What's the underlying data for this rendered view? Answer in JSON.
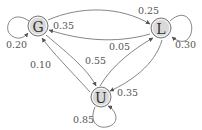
{
  "diagram": {
    "type": "markov-chain-state-diagram",
    "colors": {
      "node_fill": "#d9d9d9",
      "node_stroke": "#7a7a7a",
      "edge": "#777777",
      "text": "#333333"
    },
    "nodes": [
      {
        "id": "G",
        "label": "G"
      },
      {
        "id": "L",
        "label": "L"
      },
      {
        "id": "U",
        "label": "U"
      }
    ],
    "edges": [
      {
        "from": "G",
        "to": "G",
        "label": "0.20"
      },
      {
        "from": "G",
        "to": "L",
        "label": "0.25"
      },
      {
        "from": "L",
        "to": "G",
        "label": "0.35"
      },
      {
        "from": "L",
        "to": "L",
        "label": "0.30"
      },
      {
        "from": "U",
        "to": "G",
        "label": "0.10"
      },
      {
        "from": "G",
        "to": "U",
        "label": "0.55"
      },
      {
        "from": "U",
        "to": "L",
        "label": "0.05"
      },
      {
        "from": "L",
        "to": "U",
        "label": "0.35"
      },
      {
        "from": "U",
        "to": "U",
        "label": "0.85"
      }
    ]
  }
}
